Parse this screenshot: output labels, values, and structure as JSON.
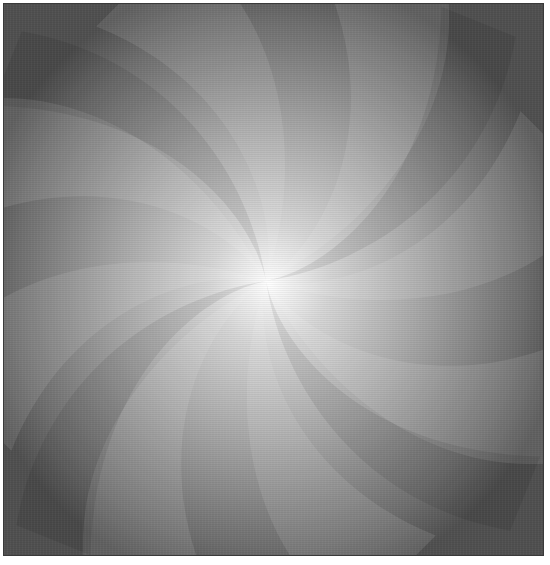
{
  "image": {
    "description": "Grayscale abstract swirl with curved petal-like blades radiating from a bright center",
    "center": [
      265,
      280
    ],
    "blade_count": 8,
    "colors": {
      "center": "#ffffff",
      "mid": "#a8a8a8",
      "edge": "#505050",
      "border": "#3a3a3a"
    }
  }
}
